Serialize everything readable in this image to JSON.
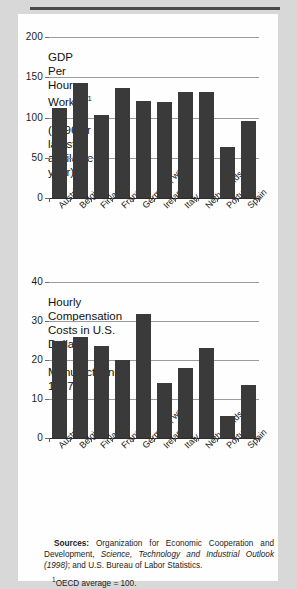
{
  "page": {
    "background_color": "#d8d8d8",
    "sheet_color": "#fefefe",
    "bar_color": "#3a3a3a",
    "gridline_color": "#9b9b9b"
  },
  "source": {
    "label": "Sources:",
    "text_part1": "  Organization for Economic Cooperation and Development, ",
    "italic": "Science, Technology and Industrial Outlook (1998)",
    "text_part2": "; and U.S. Bureau of Labor Statistics.",
    "footnote_marker": "1",
    "footnote": "OECD average = 100."
  },
  "chart_data": [
    {
      "type": "bar",
      "id": "gdp-per-hour-worked",
      "title": "GDP Per Hour Worked",
      "title_superscript": "1",
      "subtitle": "(1996 or latest available year)",
      "categories": [
        "Austria",
        "Belgium",
        "Finland",
        "France",
        "Germany, west",
        "Ireland",
        "Italy",
        "Netherlands",
        "Portugal",
        "Spain"
      ],
      "values": [
        112,
        143,
        103,
        137,
        121,
        119,
        132,
        132,
        63,
        96
      ],
      "xlabel": "",
      "ylabel": "",
      "ylim": [
        0,
        200
      ],
      "yticks": [
        0,
        50,
        100,
        150,
        200
      ],
      "ytick_labels": [
        "0",
        "50",
        "100",
        "150",
        "200"
      ],
      "grid": true,
      "legend": "none"
    },
    {
      "type": "bar",
      "id": "hourly-compensation-costs",
      "title": "Hourly Compensation Costs in U.S. Dollars,",
      "subtitle": "Manufacturing, 1997",
      "categories": [
        "Austria",
        "Belgium",
        "Finland",
        "France",
        "Germany, west",
        "Ireland",
        "Italy",
        "Netherlands",
        "Portugal",
        "Spain"
      ],
      "values": [
        24.8,
        26.0,
        23.7,
        20.1,
        31.9,
        14.0,
        18.0,
        23.2,
        5.7,
        13.7
      ],
      "xlabel": "",
      "ylabel": "",
      "ylim": [
        0,
        40
      ],
      "yticks": [
        0,
        10,
        20,
        30,
        40
      ],
      "ytick_labels": [
        "0",
        "10",
        "20",
        "30",
        "40"
      ],
      "grid": true,
      "legend": "none"
    }
  ]
}
